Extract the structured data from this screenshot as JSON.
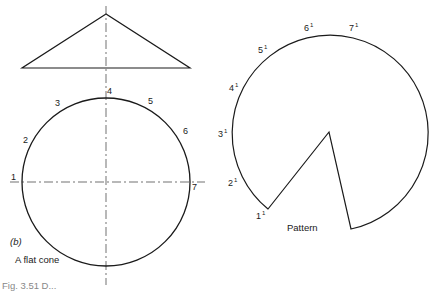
{
  "figure": {
    "sublabel": "(b)",
    "title": "A flat cone",
    "pattern_label": "Pattern",
    "cropped_caption": "Fig. 3.51 D..."
  },
  "plan_points": [
    {
      "label": "1",
      "x": 11,
      "y": 173
    },
    {
      "label": "2",
      "x": 23,
      "y": 136
    },
    {
      "label": "3",
      "x": 55,
      "y": 99
    },
    {
      "label": "4",
      "x": 107,
      "y": 87
    },
    {
      "label": "5",
      "x": 148,
      "y": 97
    },
    {
      "label": "6",
      "x": 183,
      "y": 127
    },
    {
      "label": "7",
      "x": 192,
      "y": 183
    }
  ],
  "pattern_points": [
    {
      "label": "1",
      "x": 256,
      "y": 209
    },
    {
      "label": "2",
      "x": 228,
      "y": 176
    },
    {
      "label": "3",
      "x": 218,
      "y": 127
    },
    {
      "label": "4",
      "x": 229,
      "y": 81
    },
    {
      "label": "5",
      "x": 258,
      "y": 43
    },
    {
      "label": "6",
      "x": 304,
      "y": 21
    },
    {
      "label": "7",
      "x": 349,
      "y": 21
    }
  ],
  "prime_mark": "1"
}
